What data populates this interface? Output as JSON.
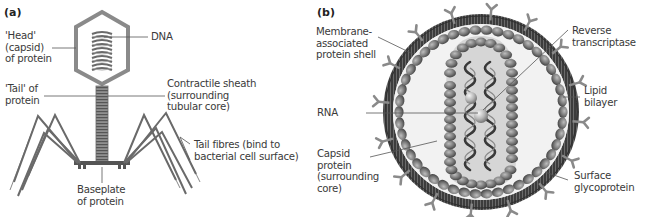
{
  "figure": {
    "panels": [
      {
        "id": "a",
        "panel_label": "(a)",
        "subject": "Bacteriophage",
        "labels": {
          "head": "'Head'\n(capsid)\nof protein",
          "dna": "DNA",
          "tail": "'Tail' of\nprotein",
          "sheath": "Contractile sheath\n(surrounding\ntubular core)",
          "fibres": "Tail fibres (bind to\nbacterial cell surface)",
          "baseplate": "Baseplate\nof protein"
        }
      },
      {
        "id": "b",
        "panel_label": "(b)",
        "subject": "Retrovirus",
        "labels": {
          "membrane_shell": "Membrane-\nassociated\nprotein shell",
          "rna": "RNA",
          "capsid": "Capsid\nprotein\n(surrounding\ncore)",
          "reverse_transcriptase": "Reverse\ntranscriptase",
          "lipid_bilayer": "Lipid\nbilayer",
          "surface_glycoprotein": "Surface\nglycoprotein"
        }
      }
    ],
    "colors": {
      "outline": "#7a7a7a",
      "dark_membrane": "#4a4a4a",
      "bead": "#6e6e6e",
      "core_fill": "#d9d9d9",
      "inner_fill": "#f0f0f0",
      "leader": "#555555",
      "text": "#3a3a3a"
    }
  }
}
